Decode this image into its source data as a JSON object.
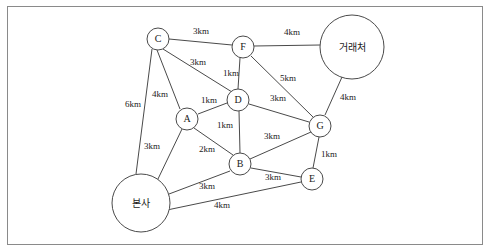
{
  "diagram": {
    "title": "",
    "nodes": [
      {
        "id": "C",
        "label": "C",
        "x": 158,
        "y": 39,
        "r": 11,
        "ko": false
      },
      {
        "id": "F",
        "label": "F",
        "x": 243,
        "y": 47,
        "r": 11,
        "ko": false
      },
      {
        "id": "VEND",
        "label": "거래처",
        "x": 352,
        "y": 47,
        "r": 32,
        "ko": true
      },
      {
        "id": "D",
        "label": "D",
        "x": 238,
        "y": 100,
        "r": 11,
        "ko": false
      },
      {
        "id": "A",
        "label": "A",
        "x": 187,
        "y": 119,
        "r": 11,
        "ko": false
      },
      {
        "id": "G",
        "label": "G",
        "x": 320,
        "y": 126,
        "r": 11,
        "ko": false
      },
      {
        "id": "B",
        "label": "B",
        "x": 240,
        "y": 164,
        "r": 11,
        "ko": false
      },
      {
        "id": "E",
        "label": "E",
        "x": 312,
        "y": 179,
        "r": 11,
        "ko": false
      },
      {
        "id": "HQ",
        "label": "본사",
        "x": 141,
        "y": 203,
        "r": 29,
        "ko": true
      }
    ],
    "edges": [
      {
        "from": "C",
        "to": "F",
        "label": "3km",
        "lx": 201,
        "ly": 32
      },
      {
        "from": "F",
        "to": "VEND",
        "label": "4km",
        "lx": 292,
        "ly": 33
      },
      {
        "from": "C",
        "to": "D",
        "label": "3km",
        "lx": 198,
        "ly": 63
      },
      {
        "from": "F",
        "to": "D",
        "label": "1km",
        "lx": 231,
        "ly": 74
      },
      {
        "from": "F",
        "to": "G",
        "label": "5km",
        "lx": 288,
        "ly": 79
      },
      {
        "from": "VEND",
        "to": "G",
        "label": "4km",
        "lx": 348,
        "ly": 98
      },
      {
        "from": "C",
        "to": "A",
        "label": "4km",
        "lx": 160,
        "ly": 95
      },
      {
        "from": "C",
        "to": "HQ",
        "label": "6km",
        "lx": 133,
        "ly": 105
      },
      {
        "from": "A",
        "to": "D",
        "label": "1km",
        "lx": 209,
        "ly": 101
      },
      {
        "from": "D",
        "to": "G",
        "label": "3km",
        "lx": 278,
        "ly": 99
      },
      {
        "from": "A",
        "to": "B",
        "label": "1km",
        "lx": 225,
        "ly": 126
      },
      {
        "from": "B",
        "to": "G",
        "label": "3km",
        "lx": 272,
        "ly": 137
      },
      {
        "from": "A",
        "to": "HQ",
        "label": "3km",
        "lx": 152,
        "ly": 147
      },
      {
        "from": "A",
        "to": "B2",
        "label": "2km",
        "lx": 207,
        "ly": 150
      },
      {
        "from": "G",
        "to": "E",
        "label": "1km",
        "lx": 329,
        "ly": 155
      },
      {
        "from": "B",
        "to": "E",
        "label": "3km",
        "lx": 273,
        "ly": 178
      },
      {
        "from": "HQ",
        "to": "B",
        "label": "3km",
        "lx": 207,
        "ly": 187
      },
      {
        "from": "HQ",
        "to": "E",
        "label": "4km",
        "lx": 222,
        "ly": 206
      }
    ]
  }
}
